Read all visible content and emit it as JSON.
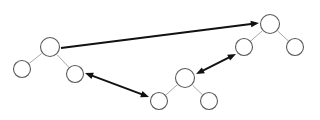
{
  "diagram": {
    "type": "node-link-diagram",
    "canvas": {
      "width": 320,
      "height": 120,
      "background": "#ffffff"
    },
    "style": {
      "node_fill": "#ffffff",
      "node_stroke": "#5a5a5a",
      "tree_edge_color": "#a9a9a9",
      "arrow_color": "#111111"
    },
    "trees": [
      {
        "id": "tree-left",
        "name": "left-tree",
        "nodes": [
          {
            "id": "L0",
            "role": "root",
            "cx": 50,
            "cy": 47,
            "r": 9.5,
            "label": ""
          },
          {
            "id": "L1",
            "role": "left-child",
            "cx": 22,
            "cy": 69,
            "r": 8.5,
            "label": ""
          },
          {
            "id": "L2",
            "role": "right-child",
            "cx": 75,
            "cy": 74,
            "r": 8.5,
            "label": ""
          }
        ],
        "edges": [
          {
            "from": "L0",
            "to": "L1"
          },
          {
            "from": "L0",
            "to": "L2"
          }
        ]
      },
      {
        "id": "tree-bottom",
        "name": "bottom-center-tree",
        "nodes": [
          {
            "id": "B0",
            "role": "root",
            "cx": 185,
            "cy": 78,
            "r": 9.5,
            "label": ""
          },
          {
            "id": "B1",
            "role": "left-child",
            "cx": 159,
            "cy": 101,
            "r": 8.5,
            "label": ""
          },
          {
            "id": "B2",
            "role": "right-child",
            "cx": 209,
            "cy": 101,
            "r": 8.5,
            "label": ""
          }
        ],
        "edges": [
          {
            "from": "B0",
            "to": "B1"
          },
          {
            "from": "B0",
            "to": "B2"
          }
        ]
      },
      {
        "id": "tree-right",
        "name": "right-tree",
        "nodes": [
          {
            "id": "R0",
            "role": "root",
            "cx": 270,
            "cy": 24,
            "r": 9.5,
            "label": ""
          },
          {
            "id": "R1",
            "role": "left-child",
            "cx": 244,
            "cy": 47,
            "r": 8.5,
            "label": ""
          },
          {
            "id": "R2",
            "role": "right-child",
            "cx": 295,
            "cy": 47,
            "r": 8.5,
            "label": ""
          }
        ],
        "edges": [
          {
            "from": "R0",
            "to": "R1"
          },
          {
            "from": "R0",
            "to": "R2"
          }
        ]
      }
    ],
    "arrows": [
      {
        "id": "arrow-long",
        "name": "arrow-left-root-to-right-root",
        "x1": 61,
        "y1": 48,
        "x2": 259,
        "y2": 23,
        "heads": "end",
        "label": ""
      },
      {
        "id": "arrow-left-bottom",
        "name": "arrow-left-child-to-bottom-child",
        "x1": 85,
        "y1": 73,
        "x2": 149,
        "y2": 97,
        "heads": "both",
        "label": ""
      },
      {
        "id": "arrow-bottom-right",
        "name": "arrow-bottom-root-to-right-child",
        "x1": 196,
        "y1": 74,
        "x2": 236,
        "y2": 54,
        "heads": "both",
        "label": ""
      }
    ]
  }
}
